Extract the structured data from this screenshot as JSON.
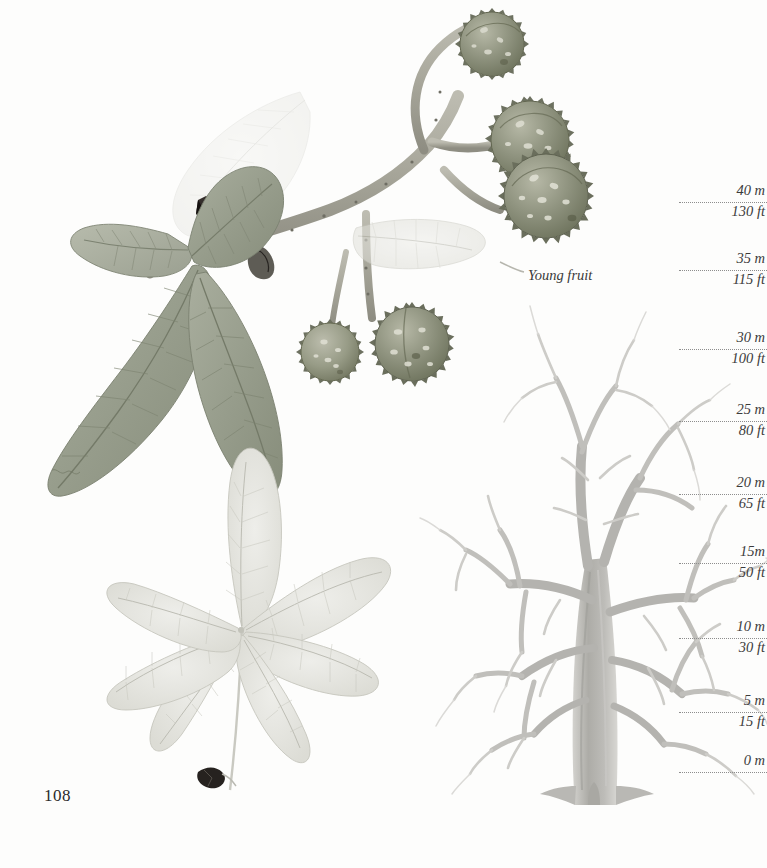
{
  "page": {
    "number": "108",
    "background_color": "#fdfdfc"
  },
  "plate": {
    "subject": "horse-chestnut",
    "caption": "Young fruit",
    "ink_color": "#3b3b3b",
    "foliage_color": "#9aa08f",
    "fruit_color": "#8f937f",
    "twig_color": "#a8a79b",
    "bud_color": "#241f1c",
    "tree_color": "#b9b8b4",
    "pale_leaf_color": "#dcdcd6"
  },
  "scale": {
    "title": "height scale",
    "unit_primary": "m",
    "unit_secondary": "ft",
    "marks": [
      {
        "metric": "40 m",
        "imperial": "130 ft",
        "y": 190
      },
      {
        "metric": "35 m",
        "imperial": "115 ft",
        "y": 258
      },
      {
        "metric": "30 m",
        "imperial": "100 ft",
        "y": 337
      },
      {
        "metric": "25 m",
        "imperial": "80 ft",
        "y": 409
      },
      {
        "metric": "20 m",
        "imperial": "65 ft",
        "y": 482
      },
      {
        "metric": "15m",
        "imperial": "50 ft",
        "y": 551
      },
      {
        "metric": "10 m",
        "imperial": "30 ft",
        "y": 626
      },
      {
        "metric": "5 m",
        "imperial": "15 ft",
        "y": 700
      },
      {
        "metric": "0 m",
        "imperial": "",
        "y": 760
      }
    ]
  },
  "chart_data": {
    "type": "table",
    "ylabel": "Height",
    "ylim": [
      0,
      40
    ],
    "categories": [
      "0 m",
      "5 m",
      "10 m",
      "15m",
      "20 m",
      "25 m",
      "30 m",
      "35 m",
      "40 m"
    ],
    "values": [
      0,
      5,
      10,
      15,
      20,
      25,
      30,
      35,
      40
    ],
    "series": [
      {
        "name": "metric",
        "values": [
          0,
          5,
          10,
          15,
          20,
          25,
          30,
          35,
          40
        ]
      },
      {
        "name": "imperial",
        "values": [
          0,
          15,
          30,
          50,
          65,
          80,
          100,
          115,
          130
        ]
      }
    ],
    "grid": true,
    "legend": "none"
  }
}
